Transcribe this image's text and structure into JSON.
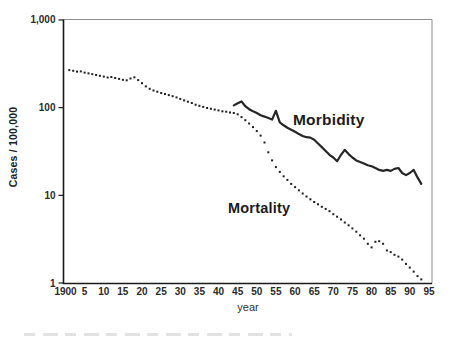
{
  "labels": {
    "morbidity": "Morbidity",
    "mortality": "Mortality"
  },
  "axis": {
    "y_title": "Cases / 100,000",
    "x_title": "year",
    "y_tick_labels": [
      "1,000",
      "100",
      "10",
      "1"
    ],
    "y_tick_values": [
      1000,
      100,
      10,
      1
    ],
    "x_tick_labels": [
      "1900",
      "5",
      "10",
      "15",
      "20",
      "25",
      "30",
      "35",
      "40",
      "45",
      "50",
      "55",
      "60",
      "65",
      "70",
      "75",
      "80",
      "85",
      "90",
      "95"
    ],
    "x_tick_years": [
      1900,
      1905,
      1910,
      1915,
      1920,
      1925,
      1930,
      1935,
      1940,
      1945,
      1950,
      1955,
      1960,
      1965,
      1970,
      1975,
      1980,
      1985,
      1990,
      1995
    ]
  },
  "colors": {
    "line": "#262626",
    "dot": "#1f1f1f",
    "axis": "#1a1a1a",
    "frame_light": "#909090",
    "text": "#2b2b2b",
    "background": "#ffffff"
  },
  "chart_data": {
    "type": "line",
    "title": "",
    "xlabel": "year",
    "ylabel": "Cases / 100,000",
    "y_scale": "log",
    "ylim": [
      1,
      1000
    ],
    "xlim": [
      1900,
      1995
    ],
    "grid": false,
    "legend": "inline-text-labels",
    "series": [
      {
        "name": "Morbidity",
        "style": "solid",
        "x_start": 1944,
        "x_step": 1,
        "values": [
          106,
          112,
          118,
          104,
          96,
          91,
          87,
          82,
          79,
          76,
          73,
          92,
          68,
          63,
          59,
          56,
          53,
          50,
          47.5,
          46,
          45.5,
          43,
          39,
          35.5,
          32,
          29,
          27,
          24.5,
          29,
          33,
          29.5,
          27,
          25,
          24,
          23,
          22,
          21.5,
          20.5,
          19.5,
          19,
          19.5,
          19,
          20,
          20.5,
          18,
          17,
          18,
          19.5,
          16,
          13.5
        ]
      },
      {
        "name": "Mortality",
        "style": "dotted",
        "x_start": 1901,
        "x_step": 1,
        "values": [
          268,
          263,
          258,
          259,
          251,
          246,
          241,
          236,
          231,
          226,
          221,
          224,
          218,
          213,
          208,
          205,
          215,
          222,
          206,
          190,
          175,
          164,
          157,
          152,
          147,
          143,
          139,
          135,
          131,
          126,
          121,
          117,
          113,
          108,
          105,
          102,
          99,
          97,
          95,
          93,
          91,
          90,
          88,
          87,
          84,
          78,
          72,
          66,
          60,
          54,
          48,
          40,
          31,
          25,
          21,
          18.5,
          16.5,
          15,
          13.5,
          12.4,
          11.4,
          10.5,
          9.7,
          9,
          8.4,
          7.9,
          7.4,
          7,
          6.6,
          6.1,
          5.7,
          5.3,
          4.9,
          4.55,
          4.2,
          3.85,
          3.5,
          3.2,
          2.8,
          2.55,
          2.95,
          3,
          2.8,
          2.35,
          2.25,
          2.1,
          2,
          1.85,
          1.65,
          1.5,
          1.35,
          1.2,
          1.1
        ]
      }
    ]
  }
}
